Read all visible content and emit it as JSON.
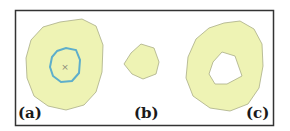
{
  "figure": {
    "panels": [
      {
        "id": "a",
        "label": "(a)",
        "description": "Large polygon region with inner blue contour and center cross"
      },
      {
        "id": "b",
        "label": "(b)",
        "description": "Small polygon region"
      },
      {
        "id": "c",
        "label": "(c)",
        "description": "Polygon region with a hole"
      }
    ],
    "center_marker": "×",
    "colors": {
      "fill": "#eef3b4",
      "edge": "#a9ad86",
      "inner_contour": "#5eaecb",
      "frame": "#333333",
      "marker": "#8a8a7a"
    }
  }
}
